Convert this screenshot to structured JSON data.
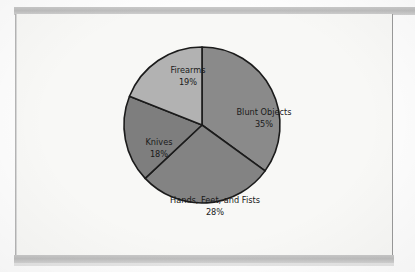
{
  "figure": {
    "background_color": "#f8f8f6",
    "outline_color": "#1b1b1b",
    "page_border_color": "#9a9a9a",
    "scan_bar_color": "#c3c3c3"
  },
  "chart_data": {
    "type": "pie",
    "title": "",
    "subtitle": "",
    "xlabel": "",
    "ylabel": "",
    "legend_position": "none",
    "grid": false,
    "labels_inside_slices": true,
    "start_angle_deg": 0,
    "direction": "clockwise",
    "categories": [
      "Blunt Objects",
      "Hands, Feet, and Fists",
      "Knives",
      "Firearms"
    ],
    "values": [
      35,
      28,
      18,
      19
    ],
    "unit": "%",
    "slices": [
      {
        "label": "Blunt Objects",
        "value": 35,
        "value_text": "35%",
        "color": "#8a8a8a",
        "start_deg": 0,
        "end_deg": 126,
        "label_x": 249,
        "label_y": 98,
        "value_x": 249,
        "value_y": 110
      },
      {
        "label": "Hands, Feet, and Fists",
        "value": 28,
        "value_text": "28%",
        "color": "#838383",
        "start_deg": 126,
        "end_deg": 226.8,
        "label_x": 200,
        "label_y": 186,
        "value_x": 200,
        "value_y": 198
      },
      {
        "label": "Knives",
        "value": 18,
        "value_text": "18%",
        "color": "#7e7e7e",
        "start_deg": 226.8,
        "end_deg": 291.6,
        "label_x": 144,
        "label_y": 128,
        "value_x": 144,
        "value_y": 140
      },
      {
        "label": "Firearms",
        "value": 19,
        "value_text": "19%",
        "color": "#b2b2b2",
        "start_deg": 291.6,
        "end_deg": 360,
        "label_x": 173,
        "label_y": 56,
        "value_x": 173,
        "value_y": 68
      }
    ],
    "geometry": {
      "center_x": 187,
      "center_y": 111,
      "radius": 78
    }
  }
}
